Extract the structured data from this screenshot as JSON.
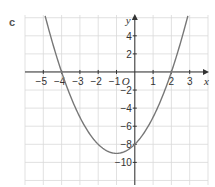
{
  "figure": {
    "label": "c"
  },
  "chart_data": {
    "type": "line",
    "title": "",
    "function": "y = x^2 + 2x - 8",
    "xlabel": "x",
    "ylabel": "y",
    "origin_label": "O",
    "xlim": [
      -6,
      4
    ],
    "ylim": [
      -12.5,
      6.3
    ],
    "grid": true,
    "x_ticks": [
      -5,
      -4,
      -3,
      -2,
      -1,
      1,
      2,
      3
    ],
    "x_tick_labels": [
      "−5",
      "−4",
      "−3",
      "−2",
      "−1",
      "1",
      "2",
      "3"
    ],
    "y_ticks": [
      4,
      2,
      -2,
      -4,
      -6,
      -8,
      -10
    ],
    "y_tick_labels": [
      "4",
      "2",
      "−2",
      "−4",
      "−6",
      "−8",
      "−10"
    ],
    "x_roots": [
      -4,
      2
    ],
    "y_intercept": -8,
    "vertex": [
      -1,
      -9
    ],
    "x": [
      -5,
      -4.5,
      -4,
      -3,
      -2,
      -1,
      0,
      1,
      2,
      2.5,
      3
    ],
    "values": [
      7,
      2.25,
      0,
      -5,
      -8,
      -9,
      -8,
      -5,
      0,
      3.25,
      7
    ],
    "colors": {
      "curve": "#777777",
      "grid": "#d9d9d9",
      "axis": "#333333"
    }
  }
}
